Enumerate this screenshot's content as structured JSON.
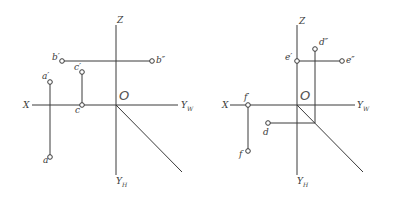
{
  "left_diagram": {
    "axes": {
      "z": "Z",
      "x": "X",
      "yw": "Y",
      "yw_sub": "W",
      "yh": "Y",
      "yh_sub": "H",
      "origin": "O"
    },
    "points": {
      "a_prime": "a′",
      "a": "a",
      "b_prime": "b′",
      "b_dprime": "b″",
      "c_prime": "c′",
      "c": "c"
    }
  },
  "right_diagram": {
    "axes": {
      "z": "Z",
      "x": "X",
      "yw": "Y",
      "yw_sub": "W",
      "yh": "Y",
      "yh_sub": "H",
      "origin": "O"
    },
    "points": {
      "d_dprime": "d″",
      "d": "d",
      "e_prime": "e′",
      "e_dprime": "e″",
      "f_prime": "f′",
      "f": "f"
    }
  },
  "colors": {
    "line": "#3a3a3a",
    "background": "#ffffff"
  }
}
